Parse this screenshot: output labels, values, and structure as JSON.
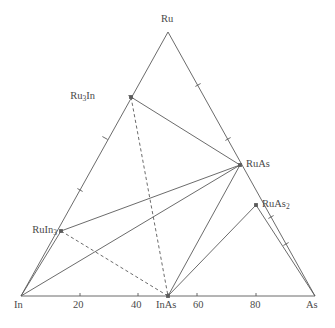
{
  "figure": {
    "type": "ternary-phase-diagram",
    "system": "Ru-In-As",
    "background_color": "#ffffff",
    "line_color": "#5a5a5a",
    "text_color": "#4a4a4a"
  },
  "chart_data": {
    "type": "scatter",
    "title": "",
    "xlabel": "",
    "ylabel": "",
    "grid": false,
    "legend": null,
    "axis_kind": "ternary",
    "corners": [
      {
        "name": "Ru",
        "label": "Ru",
        "px": [
          168,
          32
        ]
      },
      {
        "name": "In",
        "label": "In",
        "px": [
          21,
          296
        ]
      },
      {
        "name": "As",
        "label": "As",
        "px": [
          315,
          296
        ]
      }
    ],
    "bottom_axis": {
      "ticks": [
        {
          "label": "In",
          "value": 0,
          "px": [
            21,
            296
          ]
        },
        {
          "label": "20",
          "value": 20,
          "px": [
            80,
            296
          ]
        },
        {
          "label": "40",
          "value": 40,
          "px": [
            138,
            296
          ]
        },
        {
          "label": "InAs",
          "value": 50,
          "px": [
            168,
            296
          ]
        },
        {
          "label": "60",
          "value": 60,
          "px": [
            197,
            296
          ]
        },
        {
          "label": "80",
          "value": 80,
          "px": [
            256,
            296
          ]
        },
        {
          "label": "As",
          "value": 100,
          "px": [
            315,
            296
          ]
        }
      ]
    },
    "edge_ticks": [
      {
        "edge": "In-Ru",
        "px": [
          105,
          138
        ]
      },
      {
        "edge": "In-Ru",
        "px": [
          80,
          190
        ]
      },
      {
        "edge": "In-Ru",
        "px": [
          131,
          97
        ]
      },
      {
        "edge": "Ru-As",
        "px": [
          198,
          85
        ]
      },
      {
        "edge": "Ru-As",
        "px": [
          228,
          139
        ]
      },
      {
        "edge": "Ru-As",
        "px": [
          271,
          217
        ]
      },
      {
        "edge": "Ru-As",
        "px": [
          286,
          244
        ]
      }
    ],
    "points": [
      {
        "label": "Ru₃In",
        "label_html": "Ru<sub>3</sub>In",
        "px": [
          131,
          97
        ],
        "label_px": [
          92,
          91
        ],
        "label_anchor": "right"
      },
      {
        "label": "RuAs",
        "label_html": "RuAs",
        "px": [
          240,
          165
        ],
        "label_px": [
          246,
          159
        ],
        "label_anchor": "left"
      },
      {
        "label": "RuAs₂",
        "label_html": "RuAs<sub>2</sub>",
        "px": [
          256,
          205
        ],
        "label_px": [
          262,
          199
        ],
        "label_anchor": "left"
      },
      {
        "label": "RuIn₃",
        "label_html": "RuIn<sub>3</sub>",
        "px": [
          61,
          231
        ],
        "label_px": [
          19,
          225
        ],
        "label_anchor": "right"
      },
      {
        "label": "InAs",
        "label_html": "InAs",
        "px": [
          168,
          296
        ],
        "label_px": [
          157,
          300
        ],
        "label_anchor": "center"
      }
    ],
    "solid_tie_lines": [
      {
        "from": "Ru₃In",
        "to": "RuAs",
        "px": [
          131,
          97,
          240,
          165
        ]
      },
      {
        "from": "RuIn₃",
        "to": "RuAs",
        "px": [
          61,
          231,
          240,
          165
        ]
      },
      {
        "from": "In",
        "to": "RuAs",
        "px": [
          21,
          296,
          240,
          165
        ]
      },
      {
        "from": "InAs",
        "to": "RuAs",
        "px": [
          168,
          296,
          240,
          165
        ]
      },
      {
        "from": "InAs",
        "to": "RuAs₂",
        "px": [
          168,
          296,
          256,
          205
        ]
      },
      {
        "from": "In",
        "to": "RuIn₃",
        "px": [
          21,
          296,
          61,
          231
        ]
      },
      {
        "from": "RuAs₂",
        "to": "As",
        "px": [
          256,
          205,
          315,
          296
        ]
      }
    ],
    "dashed_tie_lines": [
      {
        "from": "Ru₃In",
        "to": "InAs",
        "px": [
          131,
          97,
          168,
          296
        ]
      },
      {
        "from": "RuIn₃",
        "to": "InAs",
        "px": [
          61,
          231,
          168,
          296
        ]
      }
    ],
    "triangle_edges": [
      {
        "from": "In",
        "to": "Ru",
        "px": [
          21,
          296,
          168,
          32
        ]
      },
      {
        "from": "Ru",
        "to": "As",
        "px": [
          168,
          32,
          315,
          296
        ]
      },
      {
        "from": "In",
        "to": "As",
        "px": [
          21,
          296,
          315,
          296
        ]
      }
    ]
  }
}
